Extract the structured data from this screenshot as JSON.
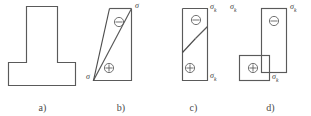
{
  "figure": {
    "type": "engineering-stress-diagram"
  },
  "panels": [
    {
      "id": "a",
      "caption": "a)",
      "kind": "cross-section",
      "shape": "T-section",
      "labels": []
    },
    {
      "id": "b",
      "caption": "b)",
      "kind": "stress-diagram",
      "zones": [
        {
          "sign": "minus-circle-icon",
          "glyph": "⊖",
          "region": "upper"
        },
        {
          "sign": "plus-circle-icon",
          "glyph": "⊕",
          "region": "lower"
        }
      ],
      "labels": [
        {
          "name": "sigma-top-right",
          "text": "σ",
          "sub": ""
        },
        {
          "name": "sigma-bottom-left",
          "text": "σ",
          "sub": ""
        }
      ]
    },
    {
      "id": "c",
      "caption": "c)",
      "kind": "stress-diagram",
      "zones": [
        {
          "sign": "minus-circle-icon",
          "glyph": "⊖",
          "region": "upper"
        },
        {
          "sign": "plus-circle-icon",
          "glyph": "⊕",
          "region": "lower"
        }
      ],
      "labels": [
        {
          "name": "sigma-top-right",
          "text": "σ",
          "sub": "k"
        },
        {
          "name": "sigma-bottom-right",
          "text": "σ",
          "sub": "k"
        }
      ]
    },
    {
      "id": "d",
      "caption": "d)",
      "kind": "stress-diagram",
      "zones": [
        {
          "sign": "minus-circle-icon",
          "glyph": "⊖",
          "region": "upper"
        },
        {
          "sign": "plus-circle-icon",
          "glyph": "⊕",
          "region": "lower"
        }
      ],
      "labels": [
        {
          "name": "sigma-top-left",
          "text": "σ",
          "sub": "k"
        },
        {
          "name": "sigma-top-right",
          "text": "σ",
          "sub": "k"
        },
        {
          "name": "sigma-bottom-right",
          "text": "σ",
          "sub": "k"
        }
      ]
    }
  ],
  "colors": {
    "stroke": "#5a5a5a",
    "text": "#4a4a4a",
    "background": "#ffffff"
  }
}
